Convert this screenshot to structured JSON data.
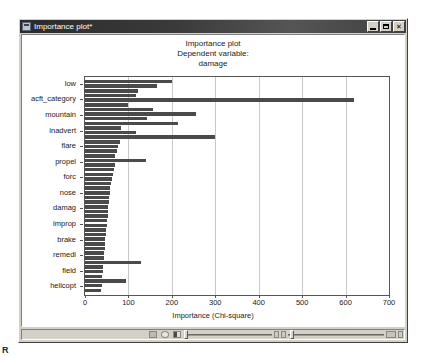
{
  "window": {
    "title": "Importance plot*",
    "icon": "app-icon",
    "controls": {
      "minimize": "minimize-button",
      "maximize": "maximize-button",
      "close_glyph": "✕"
    }
  },
  "statusbar": {
    "icons": [
      "shape-icon",
      "circle-icon",
      "contrast-icon"
    ],
    "sliders": [
      "horizontal-slider-1",
      "horizontal-slider-2"
    ],
    "right_icons": [
      "zoom-icon",
      "lock-icon"
    ]
  },
  "corner_mark": "R",
  "chart_data": {
    "type": "bar",
    "orientation": "horizontal",
    "title": "Importance plot",
    "subtitle": "Dependent variable:",
    "subtitle2": "damage",
    "xlabel": "Importance (Chi-square)",
    "ylabel": "",
    "xlim": [
      0,
      700
    ],
    "xticks": [
      0,
      100,
      200,
      300,
      400,
      500,
      600,
      700
    ],
    "xticklabels": [
      "0",
      "100",
      "200",
      "300",
      "400",
      "500",
      "600",
      "700"
    ],
    "grid": "vertical",
    "legend": "none",
    "axis_labels_shown": [
      "low",
      "acft_category",
      "mountain",
      "inadvert",
      "flare",
      "propel",
      "forc",
      "nose",
      "damag",
      "improp",
      "brake",
      "remedi",
      "field",
      "helicopt"
    ],
    "values": [
      200,
      165,
      122,
      118,
      620,
      100,
      157,
      255,
      142,
      214,
      83,
      118,
      300,
      80,
      76,
      74,
      70,
      140,
      68,
      66,
      64,
      62,
      60,
      58,
      57,
      56,
      55,
      54,
      53,
      52,
      51,
      50,
      49,
      48,
      47,
      46,
      45,
      44,
      43,
      130,
      42,
      41,
      40,
      95,
      38,
      36
    ],
    "bar_color": "#4a4a4a",
    "grid_color": "#c8c8c8",
    "frame_color": "#555555"
  }
}
